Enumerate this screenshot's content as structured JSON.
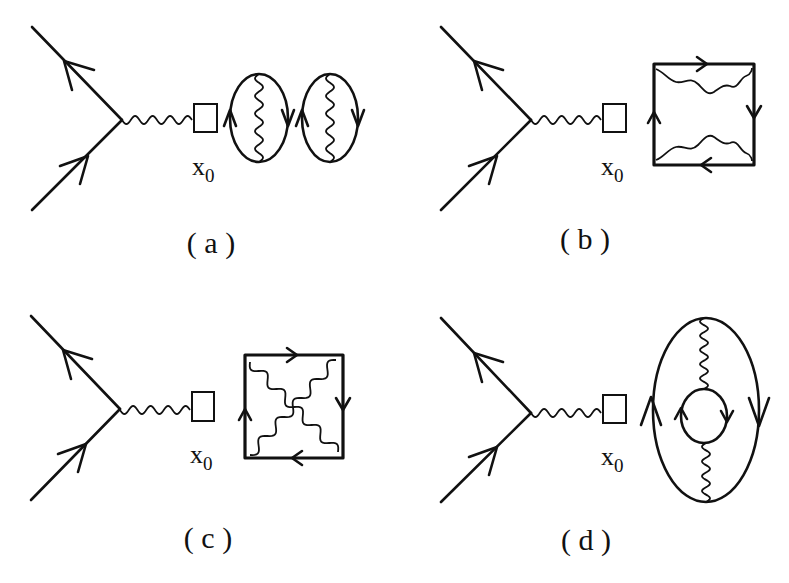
{
  "figure": {
    "panels": [
      {
        "id": "a",
        "label": "( a )",
        "vertex_label": "x",
        "vertex_subscript": "0",
        "loop_type": "two-ellipses-with-vertical-photon"
      },
      {
        "id": "b",
        "label": "( b )",
        "vertex_label": "x",
        "vertex_subscript": "0",
        "loop_type": "square-with-two-horizontal-photons"
      },
      {
        "id": "c",
        "label": "( c )",
        "vertex_label": "x",
        "vertex_subscript": "0",
        "loop_type": "square-with-crossed-diagonal-photons"
      },
      {
        "id": "d",
        "label": "( d )",
        "vertex_label": "x",
        "vertex_subscript": "0",
        "loop_type": "ellipse-with-inner-loop"
      }
    ],
    "colors": {
      "ink": "#111111",
      "background": "#ffffff"
    }
  }
}
